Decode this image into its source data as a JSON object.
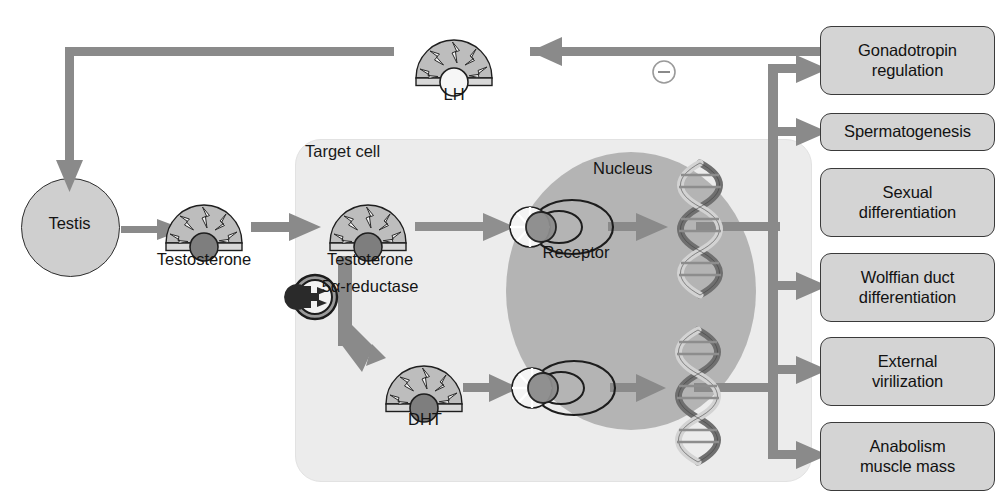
{
  "diagram": {
    "type": "biological-flow-diagram",
    "colors": {
      "arrow": "#8a8a8a",
      "box_fill": "#d4d4d4",
      "box_stroke": "#3a3a3a",
      "cell_fill": "#ececec",
      "nucleus_fill": "#b4b4b4",
      "testis_fill": "#cfcfcf",
      "hormone_fill": "#bdbdbd",
      "hormone_core_dark": "#7b7b7b",
      "hormone_core_light": "#f2f2f2",
      "text": "#141414",
      "background": "#ffffff"
    }
  },
  "nodes": {
    "testis": {
      "label": "Testis",
      "shape": "circle"
    },
    "testosterone_blood": {
      "label": "Testosterone",
      "icon": "hormone-fan-icon"
    },
    "target_cell": {
      "label": "Target cell",
      "shape": "rounded-rect"
    },
    "testosterone_cell": {
      "label": "Testoterone",
      "icon": "hormone-fan-icon"
    },
    "enzyme": {
      "label": "5α-reductase",
      "icon": "enzyme-icon"
    },
    "dht": {
      "label": "DHT",
      "icon": "hormone-fan-icon"
    },
    "lh": {
      "label": "LH",
      "icon": "hormone-fan-icon"
    },
    "nucleus": {
      "label": "Nucleus",
      "shape": "ellipse"
    },
    "receptor": {
      "label": "Receptor",
      "icon": "receptor-complex-icon"
    },
    "dna_upper": {
      "label": "",
      "icon": "dna-helix-icon"
    },
    "dna_lower": {
      "label": "",
      "icon": "dna-helix-icon"
    },
    "feedback_sign": {
      "label": "−",
      "icon": "circled-minus-icon"
    }
  },
  "outcomes": [
    {
      "id": "gonadotropin-regulation",
      "lines": [
        "Gonadotropin",
        "regulation"
      ]
    },
    {
      "id": "spermatogenesis",
      "lines": [
        "Spermatogenesis"
      ]
    },
    {
      "id": "sexual-differentiation",
      "lines": [
        "Sexual",
        "differentiation"
      ]
    },
    {
      "id": "wolffian-duct-differentiation",
      "lines": [
        "Wolffian duct",
        "differentiation"
      ]
    },
    {
      "id": "external-virilization",
      "lines": [
        "External",
        "virilization"
      ]
    },
    {
      "id": "anabolism-muscle-mass",
      "lines": [
        "Anabolism",
        "muscle mass"
      ]
    }
  ],
  "flow": [
    "Testis → Testosterone",
    "Testosterone → Target cell Testoterone",
    "Testoterone → Receptor (nucleus)",
    "Testoterone — 5α-reductase → DHT",
    "DHT → Receptor (nucleus)",
    "Receptor → DNA",
    "DNA (upper) → Gonadotropin regulation, Spermatogenesis, Wolffian duct differentiation",
    "DNA (lower) → External virilization, Anabolism muscle mass",
    "Gonadotropin regulation → LH → Testis (negative feedback −)"
  ]
}
